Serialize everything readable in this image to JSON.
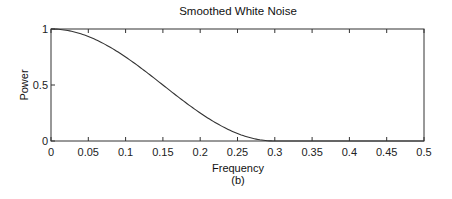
{
  "chart_data": {
    "type": "line",
    "title": "Smoothed White Noise",
    "xlabel": "Frequency",
    "sublabel": "(b)",
    "ylabel": "Power",
    "xlim": [
      0,
      0.5
    ],
    "ylim": [
      0,
      1
    ],
    "grid": false,
    "legend": null,
    "x_ticks": [
      "0",
      "0.05",
      "0.1",
      "0.15",
      "0.2",
      "0.25",
      "0.3",
      "0.35",
      "0.4",
      "0.45",
      "0.5"
    ],
    "y_ticks": [
      "0",
      "0.5",
      "1"
    ],
    "series": [
      {
        "name": "Power spectrum",
        "x": [
          0,
          0.025,
          0.05,
          0.075,
          0.1,
          0.125,
          0.15,
          0.175,
          0.2,
          0.225,
          0.25,
          0.275,
          0.3,
          0.35,
          0.4,
          0.45,
          0.5
        ],
        "values": [
          1.0,
          0.983,
          0.933,
          0.854,
          0.75,
          0.629,
          0.5,
          0.371,
          0.25,
          0.146,
          0.067,
          0.017,
          0.0,
          0.0,
          0.0,
          0.0,
          0.0
        ]
      }
    ]
  },
  "colors": {
    "line": "#333333",
    "axis": "#333333",
    "background": "#ffffff"
  }
}
